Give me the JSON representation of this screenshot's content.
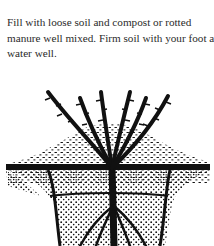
{
  "document": {
    "paragraph_lines": [
      "Fill with loose soil and compost or rotted",
      "manure well mixed. Firm soil with your foot ar",
      "water well."
    ]
  },
  "illustration": {
    "description": "Bare-root plant set in planting hole, stippled soil mound, roots spread below",
    "icon": "planting-diagram-icon",
    "ink_color": "#111111",
    "paper_color": "#ffffff"
  }
}
